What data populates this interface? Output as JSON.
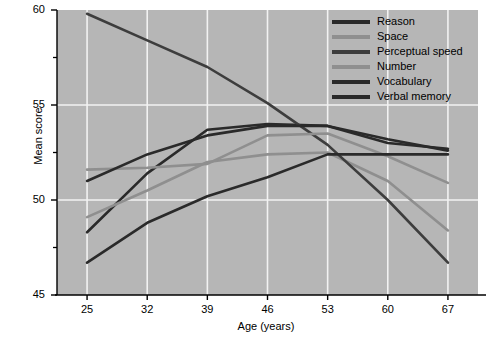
{
  "chart_data": {
    "type": "line",
    "title": "",
    "xlabel": "Age (years)",
    "ylabel": "Mean score",
    "x": [
      25,
      32,
      39,
      46,
      53,
      60,
      67
    ],
    "xlim": [
      21.5,
      70.5
    ],
    "ylim": [
      45,
      60
    ],
    "xticks": [
      "25",
      "32",
      "39",
      "46",
      "53",
      "60",
      "67"
    ],
    "yticks": [
      "45",
      "50",
      "55",
      "60"
    ],
    "yminorticks": [
      47.5,
      52.5,
      57.5
    ],
    "grid": true,
    "legend_position": "top-right",
    "plot_background": "#b6b6b6",
    "gridline_color": "#f2f2f2",
    "series": [
      {
        "name": "Reason",
        "color": "#2a2a2a",
        "width": 2.6,
        "values": [
          48.3,
          51.4,
          53.7,
          54.0,
          53.9,
          53.0,
          52.7
        ]
      },
      {
        "name": "Space",
        "color": "#8f8f8f",
        "width": 2.6,
        "values": [
          49.1,
          50.5,
          52.0,
          52.4,
          52.5,
          51.0,
          48.4
        ]
      },
      {
        "name": "Perceptual speed",
        "color": "#3d3d3d",
        "width": 2.6,
        "values": [
          59.8,
          58.4,
          57.0,
          55.1,
          52.9,
          50.0,
          46.7
        ]
      },
      {
        "name": "Number",
        "color": "#8f8f8f",
        "width": 2.6,
        "values": [
          51.6,
          51.7,
          51.9,
          53.4,
          53.5,
          52.3,
          50.9
        ]
      },
      {
        "name": "Vocabulary",
        "color": "#2a2a2a",
        "width": 2.6,
        "values": [
          51.0,
          52.4,
          53.4,
          53.9,
          53.9,
          53.2,
          52.6
        ]
      },
      {
        "name": "Verbal memory",
        "color": "#2a2a2a",
        "width": 2.6,
        "values": [
          46.7,
          48.8,
          50.2,
          51.2,
          52.4,
          52.4,
          52.4
        ]
      }
    ]
  },
  "legend": {
    "items": [
      {
        "label": "Reason",
        "color": "#2a2a2a"
      },
      {
        "label": "Space",
        "color": "#8f8f8f"
      },
      {
        "label": "Perceptual speed",
        "color": "#3d3d3d"
      },
      {
        "label": "Number",
        "color": "#8f8f8f"
      },
      {
        "label": "Vocabulary",
        "color": "#2a2a2a"
      },
      {
        "label": "Verbal memory",
        "color": "#2a2a2a"
      }
    ]
  },
  "axes": {
    "y_title": "Mean score",
    "x_title": "Age (years)",
    "y_tick_labels": [
      "60",
      "55",
      "50",
      "45"
    ],
    "x_tick_labels": [
      "25",
      "32",
      "39",
      "46",
      "53",
      "60",
      "67"
    ]
  }
}
